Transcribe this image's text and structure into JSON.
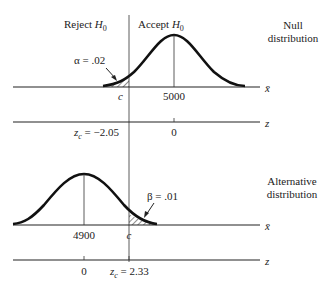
{
  "null": {
    "reject_label": "Reject ",
    "reject_h": "H",
    "reject_sub": "0",
    "accept_label": "Accept ",
    "accept_h": "H",
    "accept_sub": "0",
    "title_line1": "Null",
    "title_line2": "distribution",
    "alpha_label": "α = .02",
    "c_label": "c",
    "mean_label": "5000",
    "xbar_axis": "x̄",
    "z_axis": "z",
    "zc_label": "= −2.05",
    "zc_z": "z",
    "zc_sub": "c",
    "z0_label": "0"
  },
  "alt": {
    "title_line1": "Alternative",
    "title_line2": "distribution",
    "beta_label": "β = .01",
    "c_label": "c",
    "mean_label": "4900",
    "xbar_axis": "x̄",
    "z_axis": "z",
    "zc_label": "= 2.33",
    "zc_z": "z",
    "zc_sub": "c",
    "z0_label": "0"
  }
}
